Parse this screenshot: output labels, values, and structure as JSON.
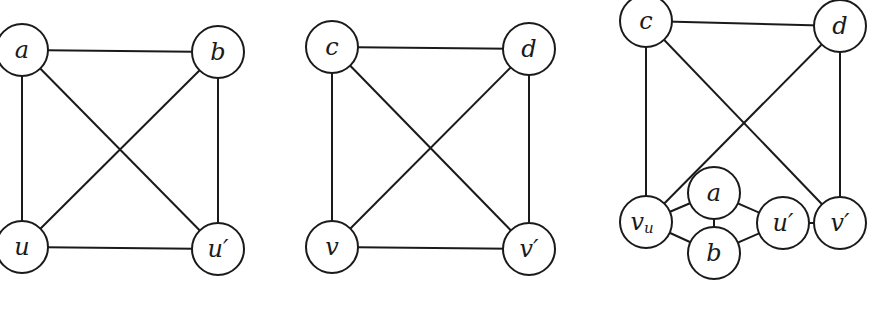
{
  "graphs": [
    {
      "id": "graph-1",
      "nodes": [
        {
          "id": "a",
          "label": "a",
          "x": 22,
          "y": 50
        },
        {
          "id": "b",
          "label": "b",
          "x": 218,
          "y": 52
        },
        {
          "id": "u",
          "label": "u",
          "x": 22,
          "y": 247
        },
        {
          "id": "u_prime",
          "label": "u′",
          "x": 218,
          "y": 249
        }
      ],
      "edges": [
        [
          "a",
          "b"
        ],
        [
          "a",
          "u"
        ],
        [
          "a",
          "u_prime"
        ],
        [
          "b",
          "u"
        ],
        [
          "b",
          "u_prime"
        ],
        [
          "u",
          "u_prime"
        ]
      ]
    },
    {
      "id": "graph-2",
      "nodes": [
        {
          "id": "c",
          "label": "c",
          "x": 332,
          "y": 47
        },
        {
          "id": "d",
          "label": "d",
          "x": 529,
          "y": 49
        },
        {
          "id": "v",
          "label": "v",
          "x": 332,
          "y": 247
        },
        {
          "id": "v_prime",
          "label": "v′",
          "x": 529,
          "y": 249
        }
      ],
      "edges": [
        [
          "c",
          "d"
        ],
        [
          "c",
          "v"
        ],
        [
          "c",
          "v_prime"
        ],
        [
          "d",
          "v"
        ],
        [
          "d",
          "v_prime"
        ],
        [
          "v",
          "v_prime"
        ]
      ]
    },
    {
      "id": "graph-3",
      "nodes": [
        {
          "id": "c",
          "label": "c",
          "x": 646,
          "y": 21
        },
        {
          "id": "d",
          "label": "d",
          "x": 840,
          "y": 26
        },
        {
          "id": "v_u",
          "label": "v",
          "sub": "u",
          "x": 646,
          "y": 222
        },
        {
          "id": "a",
          "label": "a",
          "x": 714,
          "y": 193
        },
        {
          "id": "b",
          "label": "b",
          "x": 714,
          "y": 253
        },
        {
          "id": "u_prime",
          "label": "u′",
          "x": 783,
          "y": 223
        },
        {
          "id": "v_prime",
          "label": "v′",
          "x": 840,
          "y": 223
        }
      ],
      "edges": [
        [
          "c",
          "d"
        ],
        [
          "c",
          "v_u"
        ],
        [
          "c",
          "v_prime"
        ],
        [
          "d",
          "v_u"
        ],
        [
          "d",
          "v_prime"
        ],
        [
          "v_u",
          "a"
        ],
        [
          "v_u",
          "b"
        ],
        [
          "a",
          "b"
        ],
        [
          "a",
          "u_prime"
        ],
        [
          "b",
          "u_prime"
        ],
        [
          "u_prime",
          "v_prime"
        ]
      ]
    }
  ],
  "node_radius": 26
}
